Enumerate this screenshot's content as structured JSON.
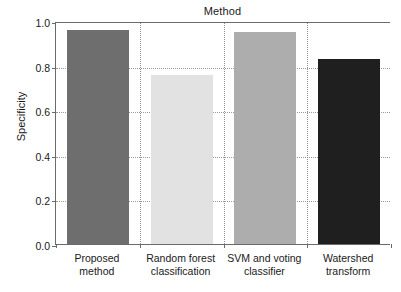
{
  "chart_data": {
    "type": "bar",
    "title": "Method",
    "xlabel": "",
    "ylabel": "Specificity",
    "categories": [
      "Proposed\nmethod",
      "Random forest\nclassification",
      "SVM and voting\nclassifier",
      "Watershed\ntransform"
    ],
    "values": [
      0.96,
      0.76,
      0.95,
      0.83
    ],
    "bar_colors": [
      "#6e6e6e",
      "#e2e2e2",
      "#adadad",
      "#1f1f1f"
    ],
    "ylim": [
      0.0,
      1.0
    ],
    "yticks": [
      "0.0",
      "0.2",
      "0.4",
      "0.6",
      "0.8",
      "1.0"
    ],
    "ytick_values": [
      0.0,
      0.2,
      0.4,
      0.6,
      0.8,
      1.0
    ],
    "grid": "dotted-both",
    "legend": "none",
    "axis_color": "#6b6b6b",
    "background": "#ffffff"
  }
}
